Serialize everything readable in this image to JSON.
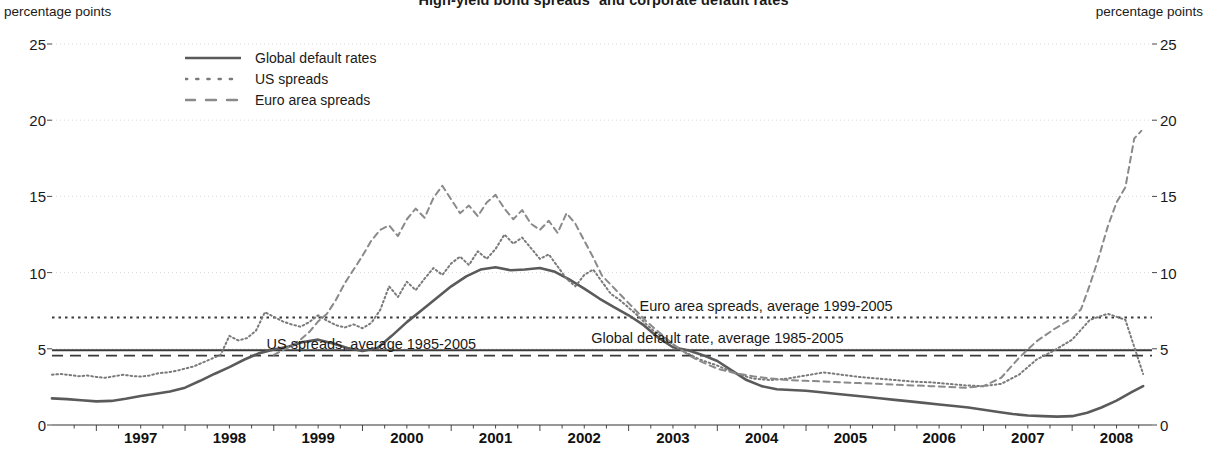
{
  "chart_data": {
    "type": "line",
    "title": "High-yield bond spreads¹ and corporate default rates",
    "xlabel": "",
    "ylabel": "percentage points",
    "unit_left": "percentage points",
    "unit_right": "percentage points",
    "ylim": [
      0,
      25
    ],
    "xlim": [
      1996.5,
      2008.9
    ],
    "yticks": [
      0,
      5,
      10,
      15,
      20,
      25
    ],
    "xticks": [
      1997,
      1998,
      1999,
      2000,
      2001,
      2002,
      2003,
      2004,
      2005,
      2006,
      2007,
      2008
    ],
    "grid": true,
    "legend_position": "top-left",
    "legend": [
      {
        "label": "Global default rates",
        "style": "solid",
        "color": "#555555"
      },
      {
        "label": "US spreads",
        "style": "dotted",
        "color": "#777777"
      },
      {
        "label": "Euro area spreads",
        "style": "dashed",
        "color": "#888888"
      }
    ],
    "annotations": [
      {
        "text": "Euro area spreads, average 1999-2005",
        "value": 7.05,
        "x": 2004.55
      },
      {
        "text": "Global default rate, average 1985-2005",
        "value": 4.9,
        "x": 2004.0
      },
      {
        "text": "US spreads, average 1985-2005",
        "value": 4.55,
        "x": 2000.1
      }
    ],
    "reference_lines": [
      {
        "name": "euro-area-average",
        "value": 7.05,
        "style": "dotted"
      },
      {
        "name": "global-default-average",
        "value": 4.9,
        "style": "solid"
      },
      {
        "name": "us-spreads-average",
        "value": 4.55,
        "style": "dashed"
      }
    ],
    "series": [
      {
        "name": "Global default rates",
        "style": "solid",
        "x": [
          1996.5,
          1996.67,
          1996.83,
          1997.0,
          1997.17,
          1997.33,
          1997.5,
          1997.67,
          1997.83,
          1998.0,
          1998.17,
          1998.33,
          1998.5,
          1998.67,
          1998.83,
          1999.0,
          1999.17,
          1999.33,
          1999.5,
          1999.67,
          1999.83,
          2000.0,
          2000.17,
          2000.33,
          2000.5,
          2000.67,
          2000.83,
          2001.0,
          2001.17,
          2001.33,
          2001.5,
          2001.67,
          2001.83,
          2002.0,
          2002.17,
          2002.33,
          2002.5,
          2002.67,
          2002.83,
          2003.0,
          2003.17,
          2003.33,
          2003.5,
          2003.67,
          2003.83,
          2004.0,
          2004.17,
          2004.33,
          2004.5,
          2004.67,
          2004.83,
          2005.0,
          2005.17,
          2005.33,
          2005.5,
          2005.67,
          2005.83,
          2006.0,
          2006.17,
          2006.33,
          2006.5,
          2006.67,
          2006.83,
          2007.0,
          2007.17,
          2007.33,
          2007.5,
          2007.67,
          2007.83,
          2008.0,
          2008.17,
          2008.33,
          2008.5,
          2008.67,
          2008.8
        ],
        "y": [
          1.75,
          1.7,
          1.62,
          1.55,
          1.58,
          1.72,
          1.9,
          2.05,
          2.2,
          2.45,
          2.9,
          3.35,
          3.8,
          4.3,
          4.7,
          4.95,
          5.15,
          5.45,
          5.6,
          5.35,
          5.05,
          4.85,
          5.05,
          5.85,
          6.75,
          7.55,
          8.3,
          9.1,
          9.75,
          10.2,
          10.35,
          10.15,
          10.2,
          10.3,
          10.05,
          9.55,
          8.95,
          8.3,
          7.75,
          7.2,
          6.55,
          5.75,
          5.1,
          4.9,
          4.6,
          4.2,
          3.55,
          2.95,
          2.55,
          2.35,
          2.3,
          2.25,
          2.15,
          2.05,
          1.95,
          1.85,
          1.75,
          1.65,
          1.55,
          1.45,
          1.35,
          1.25,
          1.15,
          1.0,
          0.85,
          0.72,
          0.62,
          0.58,
          0.55,
          0.58,
          0.8,
          1.15,
          1.6,
          2.15,
          2.55
        ]
      },
      {
        "name": "US spreads",
        "style": "dotted",
        "x": [
          1996.5,
          1996.6,
          1996.7,
          1996.8,
          1996.9,
          1997.0,
          1997.1,
          1997.2,
          1997.3,
          1997.4,
          1997.5,
          1997.6,
          1997.7,
          1997.8,
          1997.9,
          1998.0,
          1998.1,
          1998.2,
          1998.3,
          1998.4,
          1998.5,
          1998.6,
          1998.7,
          1998.8,
          1998.9,
          1999.0,
          1999.1,
          1999.2,
          1999.3,
          1999.4,
          1999.5,
          1999.6,
          1999.7,
          1999.8,
          1999.9,
          2000.0,
          2000.1,
          2000.2,
          2000.3,
          2000.4,
          2000.5,
          2000.6,
          2000.7,
          2000.8,
          2000.9,
          2001.0,
          2001.1,
          2001.2,
          2001.3,
          2001.4,
          2001.5,
          2001.6,
          2001.7,
          2001.8,
          2001.9,
          2002.0,
          2002.1,
          2002.2,
          2002.3,
          2002.4,
          2002.5,
          2002.6,
          2002.7,
          2002.8,
          2002.9,
          2003.0,
          2003.1,
          2003.2,
          2003.3,
          2003.4,
          2003.5,
          2003.6,
          2003.7,
          2003.8,
          2003.9,
          2004.0,
          2004.2,
          2004.4,
          2004.6,
          2004.8,
          2005.0,
          2005.2,
          2005.4,
          2005.6,
          2005.8,
          2006.0,
          2006.2,
          2006.4,
          2006.6,
          2006.8,
          2007.0,
          2007.2,
          2007.4,
          2007.6,
          2007.8,
          2008.0,
          2008.2,
          2008.4,
          2008.6,
          2008.8
        ],
        "y": [
          3.3,
          3.35,
          3.28,
          3.2,
          3.25,
          3.15,
          3.1,
          3.2,
          3.3,
          3.22,
          3.18,
          3.25,
          3.4,
          3.45,
          3.55,
          3.7,
          3.85,
          4.1,
          4.35,
          4.6,
          5.85,
          5.55,
          5.7,
          6.2,
          7.4,
          7.1,
          6.8,
          6.6,
          6.45,
          6.75,
          7.2,
          6.85,
          6.55,
          6.4,
          6.6,
          6.35,
          6.7,
          7.55,
          9.1,
          8.4,
          9.4,
          8.85,
          9.6,
          10.3,
          9.85,
          10.6,
          11.05,
          10.5,
          11.4,
          10.9,
          11.55,
          12.5,
          11.9,
          12.3,
          11.6,
          10.9,
          11.2,
          10.4,
          9.6,
          9.1,
          9.85,
          10.2,
          9.4,
          8.6,
          8.2,
          7.7,
          7.2,
          6.6,
          6.1,
          5.7,
          5.3,
          4.9,
          4.6,
          4.3,
          4.1,
          3.9,
          3.4,
          3.05,
          2.95,
          3.05,
          3.25,
          3.45,
          3.3,
          3.15,
          3.05,
          2.95,
          2.85,
          2.8,
          2.7,
          2.6,
          2.55,
          2.7,
          3.3,
          4.3,
          4.9,
          5.6,
          6.9,
          7.3,
          6.9,
          3.35
        ]
      },
      {
        "name": "Euro area spreads",
        "style": "dashed",
        "x": [
          1999.0,
          1999.1,
          1999.2,
          1999.3,
          1999.4,
          1999.5,
          1999.6,
          1999.7,
          1999.8,
          1999.9,
          2000.0,
          2000.1,
          2000.2,
          2000.3,
          2000.4,
          2000.5,
          2000.6,
          2000.7,
          2000.8,
          2000.9,
          2001.0,
          2001.1,
          2001.2,
          2001.3,
          2001.4,
          2001.5,
          2001.6,
          2001.7,
          2001.8,
          2001.9,
          2002.0,
          2002.1,
          2002.2,
          2002.3,
          2002.4,
          2002.5,
          2002.6,
          2002.7,
          2002.8,
          2002.9,
          2003.0,
          2003.1,
          2003.2,
          2003.3,
          2003.4,
          2003.5,
          2003.6,
          2003.7,
          2003.8,
          2003.9,
          2004.0,
          2004.2,
          2004.4,
          2004.6,
          2004.8,
          2005.0,
          2005.2,
          2005.4,
          2005.6,
          2005.8,
          2006.0,
          2006.2,
          2006.4,
          2006.6,
          2006.8,
          2007.0,
          2007.2,
          2007.4,
          2007.6,
          2007.8,
          2008.0,
          2008.1,
          2008.2,
          2008.3,
          2008.4,
          2008.5,
          2008.6,
          2008.7,
          2008.78
        ],
        "y": [
          4.6,
          4.9,
          5.2,
          5.6,
          6.1,
          6.8,
          7.3,
          8.2,
          9.3,
          10.2,
          11.1,
          12.1,
          12.8,
          13.1,
          12.4,
          13.5,
          14.2,
          13.6,
          14.9,
          15.7,
          14.8,
          13.9,
          14.4,
          13.7,
          14.6,
          15.1,
          14.2,
          13.5,
          14.1,
          13.2,
          12.8,
          13.4,
          12.6,
          13.9,
          13.2,
          12.1,
          11.0,
          9.8,
          9.2,
          8.6,
          8.0,
          7.4,
          6.8,
          6.3,
          5.8,
          5.3,
          4.9,
          4.5,
          4.2,
          3.95,
          3.7,
          3.4,
          3.2,
          3.05,
          2.95,
          2.9,
          2.85,
          2.8,
          2.75,
          2.7,
          2.65,
          2.6,
          2.55,
          2.5,
          2.45,
          2.55,
          3.1,
          4.4,
          5.5,
          6.3,
          7.0,
          7.6,
          9.2,
          11.0,
          13.0,
          14.6,
          15.6,
          18.8,
          19.3
        ]
      }
    ]
  }
}
